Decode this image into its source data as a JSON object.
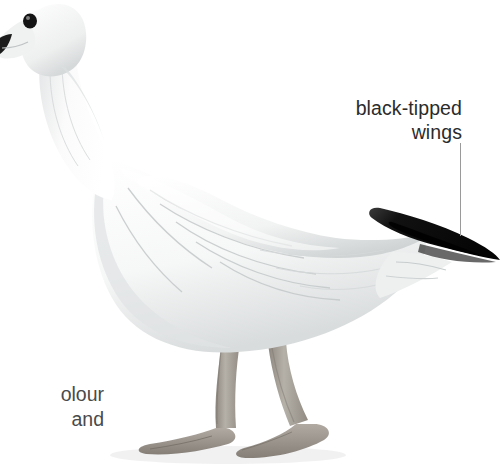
{
  "figure": {
    "background_color": "#ffffff",
    "body_color": "#f7f8f8",
    "shadow_color": "#c9cccd",
    "wingtip_color": "#121212",
    "leg_color": "#a9a49c",
    "eye_color": "#1a1a1a",
    "bill_tip_color": "#1c1c1c"
  },
  "annotations": {
    "wingtip": {
      "line1": "black-tipped",
      "line2": "wings",
      "text_color": "#2b2b2b",
      "leader_color": "#9a9a9a"
    },
    "caption": {
      "line1": "olour",
      "line2": "and",
      "text_color": "#4a4a4a"
    }
  }
}
